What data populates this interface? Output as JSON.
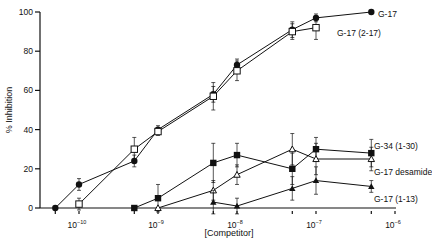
{
  "chart_data": {
    "type": "line",
    "title": "",
    "xlabel": "[Competitor]",
    "ylabel": "% Inhibition",
    "xscale": "log",
    "xlim_log10": [
      -10.3,
      -6
    ],
    "ylim": [
      0,
      100
    ],
    "y_ticks": [
      0,
      20,
      40,
      60,
      80,
      100
    ],
    "x_ticks": [
      {
        "log": -10,
        "label_base": "10",
        "label_exp": "−10"
      },
      {
        "log": -9,
        "label_base": "10",
        "label_exp": "−9"
      },
      {
        "log": -8,
        "label_base": "10",
        "label_exp": "−8"
      },
      {
        "log": -7,
        "label_base": "10",
        "label_exp": "−7"
      },
      {
        "log": -6,
        "label_base": "10",
        "label_exp": "−6"
      }
    ],
    "grid": false,
    "legend_position": "inline labels at right end of each series",
    "series": [
      {
        "name": "G-17",
        "marker": "filled-circle",
        "x_log": [
          -10.3,
          -10,
          -9.3,
          -9,
          -8.3,
          -8,
          -7.3,
          -7,
          -6.3
        ],
        "values": [
          0,
          12,
          24,
          40,
          58,
          73,
          91,
          97,
          100
        ],
        "errors": [
          0,
          3,
          3,
          2,
          4,
          3,
          4,
          2,
          0
        ]
      },
      {
        "name": "G-17 (2-17)",
        "marker": "open-square",
        "x_log": [
          -10,
          -9.3,
          -9,
          -8.3,
          -8,
          -7.3,
          -7
        ],
        "values": [
          2,
          30,
          39,
          57,
          70,
          90,
          92
        ],
        "errors": [
          3,
          6,
          2,
          7,
          5,
          4,
          6
        ]
      },
      {
        "name": "G-34 (1-30)",
        "marker": "filled-square",
        "x_log": [
          -9.3,
          -9,
          -8.3,
          -8,
          -7.3,
          -7,
          -6.3
        ],
        "values": [
          0,
          5,
          23,
          27,
          20,
          30,
          28
        ],
        "errors": [
          0,
          7,
          10,
          6,
          8,
          6,
          7
        ]
      },
      {
        "name": "G-17 desamide",
        "marker": "open-triangle",
        "x_log": [
          -9,
          -8.3,
          -8,
          -7.3,
          -7,
          -6.3
        ],
        "values": [
          0,
          9,
          17,
          30,
          25,
          25
        ],
        "errors": [
          0,
          5,
          5,
          8,
          8,
          6
        ]
      },
      {
        "name": "G-17 (1-13)",
        "marker": "filled-triangle",
        "x_log": [
          -8.3,
          -8,
          -7.3,
          -7,
          -6.3
        ],
        "values": [
          3,
          1,
          10,
          14,
          11
        ],
        "errors": [
          6,
          4,
          6,
          7,
          3
        ]
      }
    ]
  }
}
